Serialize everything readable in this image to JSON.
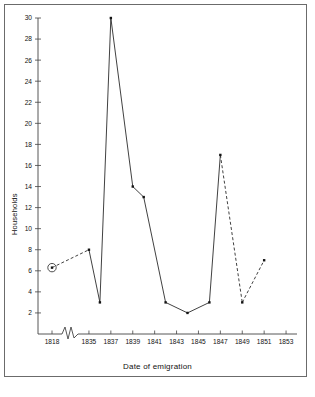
{
  "figure": {
    "background": "#ffffff",
    "frame_color": "#6b6b6b",
    "ink_color": "#2b2b2b"
  },
  "axes": {
    "ylabel": "Households",
    "xlabel": "Date of emigration",
    "y_ticks": [
      2,
      4,
      6,
      8,
      10,
      12,
      14,
      16,
      18,
      20,
      22,
      24,
      26,
      28,
      30
    ],
    "x_ticks": [
      1818,
      1835,
      1837,
      1839,
      1841,
      1843,
      1845,
      1847,
      1849,
      1851,
      1853
    ],
    "axis_break_label": "axis-break-zigzag"
  },
  "chart_data": {
    "type": "line",
    "title": "",
    "xlabel": "Date of emigration",
    "ylabel": "Households",
    "xlim": [
      1818,
      1854
    ],
    "ylim": [
      0,
      30
    ],
    "axis_break": {
      "present": true,
      "between": [
        1818,
        1835
      ],
      "style": "zigzag"
    },
    "grid": false,
    "legend": null,
    "x": [
      1818,
      1835,
      1836,
      1837,
      1839,
      1840,
      1842,
      1844,
      1846,
      1847,
      1849,
      1851
    ],
    "values": [
      6.3,
      8,
      3,
      30,
      14,
      13,
      3,
      2,
      3,
      17,
      3,
      7
    ],
    "points": [
      {
        "x": 1818,
        "y": 6.3,
        "marker": "circled-dot",
        "highlighted": true,
        "segment_to_next": "dashed"
      },
      {
        "x": 1835,
        "y": 8,
        "marker": "dot",
        "highlighted": false,
        "segment_to_next": "solid"
      },
      {
        "x": 1836,
        "y": 3,
        "marker": "dot",
        "highlighted": false,
        "segment_to_next": "solid"
      },
      {
        "x": 1837,
        "y": 30,
        "marker": "dot",
        "highlighted": false,
        "segment_to_next": "solid"
      },
      {
        "x": 1839,
        "y": 14,
        "marker": "dot",
        "highlighted": false,
        "segment_to_next": "solid"
      },
      {
        "x": 1840,
        "y": 13,
        "marker": "dot",
        "highlighted": false,
        "segment_to_next": "solid"
      },
      {
        "x": 1842,
        "y": 3,
        "marker": "dot",
        "highlighted": false,
        "segment_to_next": "solid"
      },
      {
        "x": 1844,
        "y": 2,
        "marker": "dot",
        "highlighted": false,
        "segment_to_next": "solid"
      },
      {
        "x": 1846,
        "y": 3,
        "marker": "dot",
        "highlighted": false,
        "segment_to_next": "solid"
      },
      {
        "x": 1847,
        "y": 17,
        "marker": "dot",
        "highlighted": false,
        "segment_to_next": "dashed"
      },
      {
        "x": 1849,
        "y": 3,
        "marker": "dot",
        "highlighted": false,
        "segment_to_next": "dashed"
      },
      {
        "x": 1851,
        "y": 7,
        "marker": "dot",
        "highlighted": false,
        "segment_to_next": null
      }
    ],
    "line_styles": {
      "solid_label": "solid",
      "dashed_label": "dashed"
    }
  }
}
